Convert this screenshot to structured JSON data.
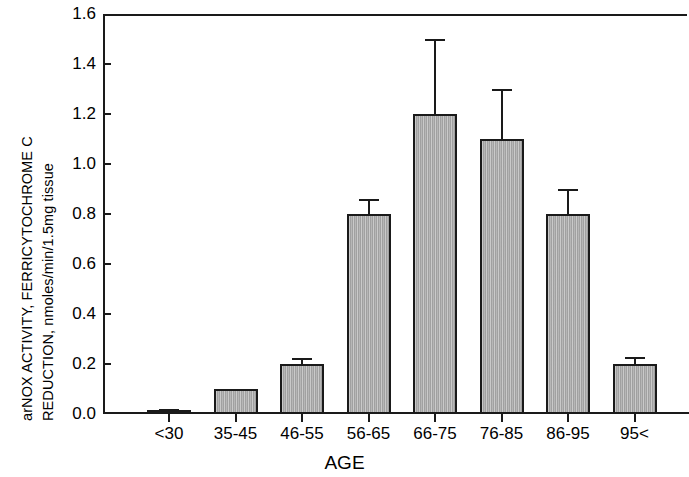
{
  "chart_data": {
    "type": "bar",
    "title": "",
    "xlabel": "AGE",
    "ylabel": "arNOX ACTIVITY, FERRICYTOCHROME C REDUCTION, nmoles/min/1.5mg tissue",
    "ylabel_line1": "arNOX ACTIVITY, FERRICYTOCHROME C",
    "ylabel_line2": "REDUCTION, nmoles/min/1.5mg tissue",
    "categories": [
      "<30",
      "35-45",
      "46-55",
      "56-65",
      "66-75",
      "76-85",
      "86-95",
      "95<"
    ],
    "values": [
      0.01,
      0.1,
      0.2,
      0.8,
      1.2,
      1.1,
      0.8,
      0.2
    ],
    "errors": [
      0.01,
      0.0,
      0.025,
      0.06,
      0.3,
      0.2,
      0.1,
      0.03
    ],
    "error_type": "upper",
    "ylim": [
      0.0,
      1.6
    ],
    "ytick_values": [
      0.0,
      0.2,
      0.4,
      0.6,
      0.8,
      1.0,
      1.2,
      1.4,
      1.6
    ],
    "ytick_labels": [
      "0.0",
      "0.2",
      "0.4",
      "0.6",
      "0.8",
      "1.0",
      "1.2",
      "1.4",
      "1.6"
    ],
    "grid": false,
    "legend": false,
    "bar_color": "#a9a9a9",
    "bar_edge_color": "#1a1a1a",
    "axis_color": "#1a1a1a"
  }
}
